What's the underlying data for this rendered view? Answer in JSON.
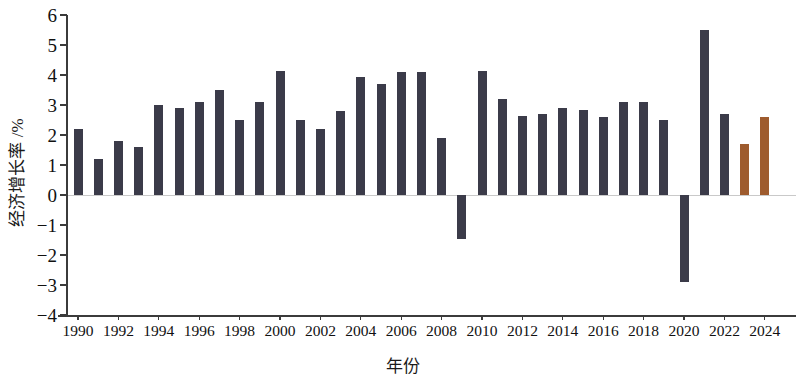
{
  "chart_data": {
    "type": "bar",
    "title": "",
    "xlabel": "年份",
    "ylabel": "经济增长率 /%",
    "ylim": [
      -4,
      6
    ],
    "ytick_labels": [
      "6",
      "5",
      "4",
      "3",
      "2",
      "1",
      "0",
      "-1",
      "-2",
      "-3",
      "-4"
    ],
    "ytick_values": [
      6,
      5,
      4,
      3,
      2,
      1,
      0,
      -1,
      -2,
      -3,
      -4
    ],
    "xtick_labels": [
      "1990",
      "1992",
      "1994",
      "1996",
      "1998",
      "2000",
      "2002",
      "2004",
      "2006",
      "2008",
      "2010",
      "2012",
      "2014",
      "2016",
      "2018",
      "2020",
      "2022",
      "2024"
    ],
    "grid": false,
    "legend": "none",
    "categories": [
      "1990",
      "1991",
      "1992",
      "1993",
      "1994",
      "1995",
      "1996",
      "1997",
      "1998",
      "1999",
      "2000",
      "2001",
      "2002",
      "2003",
      "2004",
      "2005",
      "2006",
      "2007",
      "2008",
      "2009",
      "2010",
      "2011",
      "2012",
      "2013",
      "2014",
      "2015",
      "2016",
      "2017",
      "2018",
      "2019",
      "2020",
      "2021",
      "2022",
      "2023",
      "2024"
    ],
    "values": [
      2.2,
      1.2,
      1.8,
      1.6,
      3.0,
      2.9,
      3.1,
      3.5,
      2.5,
      3.1,
      4.15,
      2.5,
      2.2,
      2.8,
      3.95,
      3.7,
      4.1,
      4.1,
      1.9,
      -1.45,
      4.15,
      3.2,
      2.65,
      2.7,
      2.9,
      2.85,
      2.6,
      3.1,
      3.1,
      2.5,
      -2.9,
      5.5,
      2.7,
      1.7,
      2.6
    ],
    "bar_colors": [
      "dark",
      "dark",
      "dark",
      "dark",
      "dark",
      "dark",
      "dark",
      "dark",
      "dark",
      "dark",
      "dark",
      "dark",
      "dark",
      "dark",
      "dark",
      "dark",
      "dark",
      "dark",
      "dark",
      "dark",
      "dark",
      "dark",
      "dark",
      "dark",
      "dark",
      "dark",
      "dark",
      "dark",
      "dark",
      "dark",
      "dark",
      "dark",
      "dark",
      "accent",
      "accent"
    ],
    "colors": {
      "dark": "#3b3b49",
      "accent": "#9e5b2e",
      "axis": "#3b3b3b",
      "text": "#111111"
    }
  }
}
